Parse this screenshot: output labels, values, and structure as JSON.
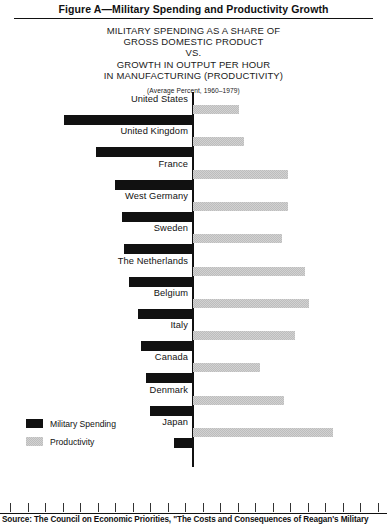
{
  "figure": {
    "title": "Figure A—Military Spending and Productivity Growth",
    "subtitle_lines": [
      "MILITARY SPENDING AS A SHARE OF",
      "GROSS DOMESTIC PRODUCT",
      "VS.",
      "GROWTH IN OUTPUT PER HOUR",
      "IN MANUFACTURING (PRODUCTIVITY)"
    ],
    "note": "(Average Percent, 1960–1979)",
    "axis_label": "Percent",
    "source": "Source: The Council on Economic Priorities, \"The Costs and Consequences of Reagan's Military"
  },
  "legend": {
    "military_label": "Military Spending",
    "productivity_label": "Productivity"
  },
  "colors": {
    "military": "#111111",
    "productivity": "#d2d2d2",
    "axis": "#111111"
  },
  "chart_data": {
    "type": "bar",
    "title": "MILITARY SPENDING AS A SHARE OF GROSS DOMESTIC PRODUCT VS. GROWTH IN OUTPUT PER HOUR IN MANUFACTURING (PRODUCTIVITY)",
    "subtitle": "(Average Percent, 1960–1979)",
    "orientation": "horizontal-diverging",
    "xlabel": "Percent",
    "ylabel": "",
    "grid": false,
    "legend_position": "bottom-left",
    "xlim": [
      0,
      10
    ],
    "tick_labels": [
      "1",
      "2",
      "3",
      "4",
      "5",
      "6",
      "7",
      "8",
      "9",
      "10"
    ],
    "categories": [
      "United States",
      "United Kingdom",
      "France",
      "West Germany",
      "Sweden",
      "The Netherlands",
      "Belgium",
      "Italy",
      "Canada",
      "Denmark",
      "Japan"
    ],
    "series": [
      {
        "name": "Military Spending",
        "direction": "left",
        "values": [
          7.4,
          5.6,
          4.5,
          4.1,
          4.0,
          3.7,
          3.2,
          3.0,
          2.7,
          2.5,
          1.1
        ]
      },
      {
        "name": "Productivity",
        "direction": "right",
        "values": [
          2.6,
          2.9,
          5.4,
          5.4,
          5.1,
          6.4,
          6.6,
          5.8,
          3.8,
          5.2,
          8.0
        ]
      }
    ]
  }
}
